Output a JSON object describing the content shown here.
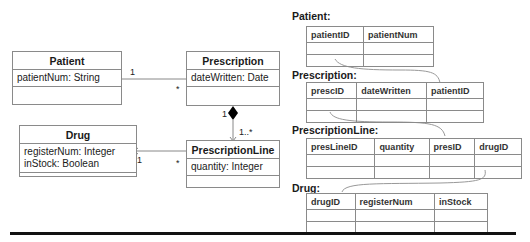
{
  "uml": {
    "classes": [
      {
        "name": "Patient",
        "attributes": [
          "patientNum: String"
        ]
      },
      {
        "name": "Prescription",
        "attributes": [
          "dateWritten: Date"
        ]
      },
      {
        "name": "PrescriptionLine",
        "attributes": [
          "quantity: Integer"
        ]
      },
      {
        "name": "Drug",
        "attributes": [
          "registerNum: Integer",
          "inStock: Boolean"
        ]
      }
    ],
    "multiplicities": {
      "patient_side": "1",
      "prescription_side": "*",
      "composition_whole": "1",
      "composition_part": "1..*",
      "drug_side": "1",
      "line_side": "*"
    }
  },
  "relations": [
    {
      "label": "Patient:",
      "columns": [
        "patientID",
        "patientNum"
      ]
    },
    {
      "label": "Prescription:",
      "columns": [
        "prescID",
        "dateWritten",
        "patientID"
      ]
    },
    {
      "label": "PrescriptionLine:",
      "columns": [
        "presLineID",
        "quantity",
        "presID",
        "drugID"
      ]
    },
    {
      "label": "Drug:",
      "columns": [
        "drugID",
        "registerNum",
        "inStock"
      ]
    }
  ]
}
